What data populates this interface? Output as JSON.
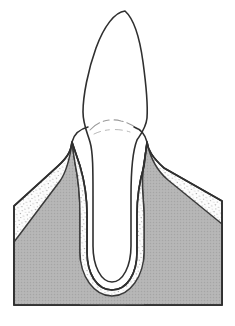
{
  "figure": {
    "caption": "",
    "width": 235,
    "height": 326,
    "background_color": "#ffffff",
    "line_color": "#2b2b2b",
    "style": "line drawing, halftone shading"
  },
  "colors": {
    "outline": "#2f2f2f",
    "bone_fill": "#b3b3b3",
    "bone_edge": "#3a3a3a",
    "gingiva_fill": "#fdfdfd",
    "gingiva_stipple": "#8d8d8d",
    "tooth_fill": "#ffffff",
    "cej_line": "#9a9a9a",
    "page_background": "#ffffff"
  },
  "structures": [
    {
      "id": "tooth",
      "label": "Tooth",
      "description": "Single-rooted anterior tooth with pointed incisal crown and tapering root",
      "fill": "#ffffff",
      "stroke": "#2f2f2f"
    },
    {
      "id": "crown",
      "label": "Crown",
      "description": "Enamel-covered coronal portion above the gingival margin",
      "fill": "#ffffff"
    },
    {
      "id": "root",
      "label": "Root",
      "description": "Tapering root housed in the alveolar socket with rounded apex",
      "fill": "#ffffff"
    },
    {
      "id": "cej",
      "label": "Cementoenamel junction",
      "description": "Faint curved line marking the cervical line on the crown",
      "stroke": "#9a9a9a"
    },
    {
      "id": "gingiva",
      "label": "Gingiva",
      "description": "Stippled white soft tissue forming interdental papillae around the tooth neck",
      "fill": "#fdfdfd",
      "stipple": "#8d8d8d"
    },
    {
      "id": "periodontal-ligament",
      "label": "Periodontal ligament space",
      "description": "Narrow stippled band lining the socket between root and bone",
      "fill": "#fdfdfd",
      "stipple": "#8d8d8d"
    },
    {
      "id": "alveolar-bone",
      "label": "Alveolar bone",
      "description": "Solid gray halftone bone block with pointed interdental crests",
      "fill": "#b3b3b3",
      "stroke": "#3a3a3a"
    },
    {
      "id": "alveolar-crest-left",
      "label": "Left alveolar crest",
      "description": "Pointed bone peak mesial to the tooth"
    },
    {
      "id": "alveolar-crest-right",
      "label": "Right alveolar crest",
      "description": "Pointed bone peak distal to the tooth"
    },
    {
      "id": "socket",
      "label": "Alveolar socket",
      "description": "U-shaped cavity in bone enclosing the root"
    }
  ],
  "geometry": {
    "crown_tip": {
      "x": 125,
      "y": 10
    },
    "crown_widest": {
      "y": 78,
      "width": 62
    },
    "gingival_margin": {
      "y": 128
    },
    "alveolar_crest_left": {
      "x": 72,
      "y": 142
    },
    "alveolar_crest_right": {
      "x": 146,
      "y": 142
    },
    "root_apex": {
      "x": 112,
      "y": 288
    },
    "block_left_edge_x": 14,
    "block_right_edge_x": 222,
    "block_bottom_y": 305
  }
}
